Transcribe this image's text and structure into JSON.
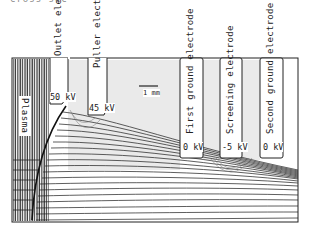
{
  "figure": {
    "caption_fragment": "cross-sec",
    "plasma_label": "Plasma",
    "scale_bar": {
      "label": "1 mm"
    },
    "electrodes": [
      {
        "name": "Outlet electrode",
        "voltage": "50 kV"
      },
      {
        "name": "Puller electrode",
        "voltage": "45 kV"
      },
      {
        "name": "First ground electrode",
        "voltage": "0 kV"
      },
      {
        "name": "Screening electrode",
        "voltage": "-5 kV"
      },
      {
        "name": "Second ground electrode",
        "voltage": "0 kV"
      }
    ],
    "colors": {
      "line": "#1a1a1a",
      "hatch": "#9a9a9a",
      "background": "#ffffff"
    }
  }
}
